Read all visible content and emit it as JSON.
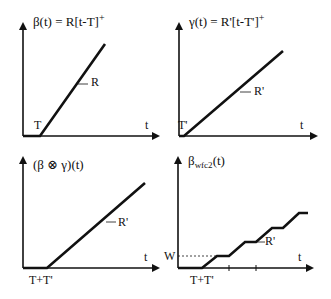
{
  "panels": [
    {
      "id": "beta",
      "title_prefix": "β(t) = R[t-T]",
      "title_sup": "+",
      "x_label": "t",
      "slope_label": "R",
      "offset_label": "T"
    },
    {
      "id": "gamma",
      "title_prefix": "γ(t) = R'[t-T']",
      "title_sup": "+",
      "x_label": "t",
      "slope_label": "R'",
      "offset_label": "T'"
    },
    {
      "id": "convolution",
      "title": "(β ⊗ γ)(t)",
      "x_label": "t",
      "slope_label": "R'",
      "offset_label": "T+T'"
    },
    {
      "id": "wfc2",
      "title_main": "β",
      "title_sub": "wfc2",
      "title_suffix": "(t)",
      "x_label": "t",
      "slope_label": "R'",
      "offset_label": "T+T'",
      "level_label": "W"
    }
  ],
  "colors": {
    "line": "#111111",
    "background": "#ffffff"
  }
}
